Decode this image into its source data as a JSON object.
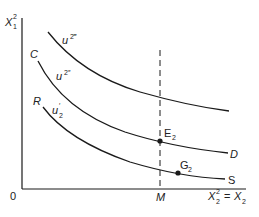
{
  "diagram": {
    "type": "indifference-curve-diagram",
    "axes": {
      "y_label": "X",
      "y_label_sup": "2",
      "y_label_sub": "1",
      "x_label_left": "X",
      "x_label_left_sup": "2",
      "x_label_left_sub": "2",
      "x_label_eq": "=",
      "x_label_right": "X",
      "x_label_right_sub": "2",
      "origin": "0"
    },
    "curves": [
      {
        "id": "top",
        "label": "u",
        "label_sup": "2‴",
        "start": "",
        "end": ""
      },
      {
        "id": "middle",
        "label": "u",
        "label_sup": "2″",
        "start": "C",
        "end": "D"
      },
      {
        "id": "bottom",
        "label": "u",
        "label_sup": "′",
        "label_sub": "2",
        "start": "R",
        "end": "S"
      }
    ],
    "vertical_line": {
      "label": "M",
      "style": "dashed"
    },
    "points": [
      {
        "label": "E",
        "sub": "2",
        "on": "middle"
      },
      {
        "label": "G",
        "sub": "2",
        "on": "bottom"
      }
    ],
    "colors": {
      "ink": "#1a1a1a",
      "background": "#ffffff"
    }
  }
}
